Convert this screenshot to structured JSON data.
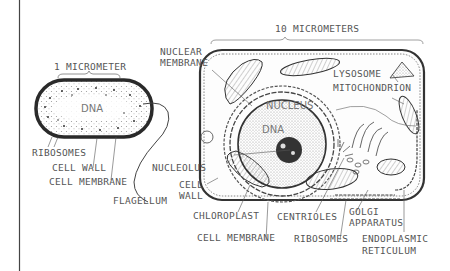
{
  "prokaryote": {
    "scale_label": "1 MICROMETER",
    "dna_label": "DNA",
    "labels": {
      "ribosomes": "RIBOSOMES",
      "cell_wall": "CELL WALL",
      "cell_membrane": "CELL MEMBRANE",
      "flagellum": "FLAGELLUM"
    }
  },
  "eukaryote": {
    "scale_label": "10 MICROMETERS",
    "nucleus_label": "NUCLEUS",
    "dna_label": "DNA",
    "labels": {
      "nuclear_membrane_l1": "NUCLEAR",
      "nuclear_membrane_l2": "MEMBRANE",
      "lysosome": "LYSOSOME",
      "mitochondrion": "MITOCHONDRION",
      "nucleolus": "NUCLEOLUS",
      "cell_wall_l1": "CELL",
      "cell_wall_l2": "WALL",
      "chloroplast": "CHLOROPLAST",
      "cell_membrane": "CELL MEMBRANE",
      "centrioles": "CENTRIOLES",
      "ribosomes": "RIBOSOMES",
      "golgi_l1": "GOLGI",
      "golgi_l2": "APPARATUS",
      "er_l1": "ENDOPLASMIC",
      "er_l2": "RETICULUM"
    }
  },
  "colors": {
    "ink": "#333333",
    "label": "#555555",
    "stipple": "#888888",
    "background": "#ffffff"
  }
}
